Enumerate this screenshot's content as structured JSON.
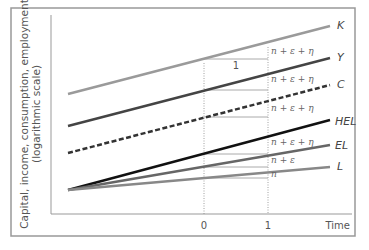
{
  "figure": {
    "y_axis_label_line1": "Capital, income, consumption, employment",
    "y_axis_label_line2": "(logarithmic scale)",
    "x_axis_label": "Time",
    "x_ticks": [
      "0",
      "1"
    ],
    "step_label": "1"
  },
  "series": [
    {
      "name": "K",
      "style": "solid",
      "color": "#9a9a9a",
      "growth_label": "n + ε + η"
    },
    {
      "name": "Y",
      "style": "solid",
      "color": "#444444",
      "growth_label": "n + ε + η"
    },
    {
      "name": "C",
      "style": "dashed",
      "color": "#333333",
      "growth_label": "n + ε + η"
    },
    {
      "name": "HEL",
      "style": "solid",
      "color": "#111111",
      "growth_label": "n + ε + η"
    },
    {
      "name": "EL",
      "style": "solid",
      "color": "#666666",
      "growth_label": "n + ε"
    },
    {
      "name": "L",
      "style": "solid",
      "color": "#888888",
      "growth_label": "n"
    }
  ]
}
